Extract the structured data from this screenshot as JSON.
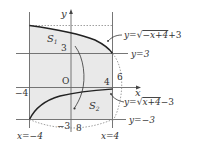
{
  "figure": {
    "type": "area-between-curves",
    "axes": {
      "x_label": "x",
      "y_label": "y",
      "origin_label": "O"
    },
    "curves": {
      "upper": {
        "label": "y=√−x+4 +3",
        "prefix": "y=",
        "radicand": "−x+4",
        "suffix": "+3"
      },
      "lower": {
        "label": "y=√x+4 −3",
        "prefix": "y=",
        "radicand": "x+4",
        "suffix": "−3"
      }
    },
    "lines": {
      "y_eq_3": "y=3",
      "y_eq_neg3": "y=−3",
      "x_eq_neg4": "x=−4",
      "x_eq_4": "x=4"
    },
    "regions": {
      "s1_main": "S",
      "s1_sub": "1",
      "s2_main": "S",
      "s2_sub": "2"
    },
    "tick_labels": {
      "y3": "3",
      "x4": "4",
      "xneg4": "−4",
      "yneg3": "−3",
      "six": "6",
      "eight": "8"
    },
    "colors": {
      "shade": "#e9e9e9",
      "line": "#555555",
      "curve": "#222222",
      "dotted": "#888888"
    }
  }
}
